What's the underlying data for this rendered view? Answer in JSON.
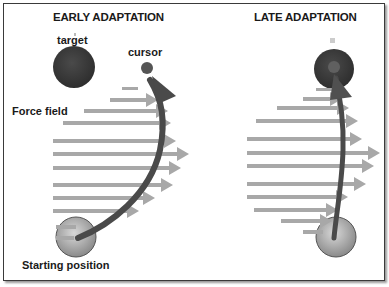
{
  "panels": {
    "early": {
      "title": "EARLY ADAPTATION",
      "labels": {
        "target": "target",
        "cursor": "cursor",
        "force_field": "Force field",
        "start": "Starting position"
      }
    },
    "late": {
      "title": "LATE ADAPTATION"
    }
  },
  "colors": {
    "target": "#3c3c3c",
    "cursor": "#505050",
    "arrow": "#a8a8a8",
    "trajectory": "#4a4a4a",
    "start": "#9a9a9a",
    "border": "#3a3a3a"
  }
}
